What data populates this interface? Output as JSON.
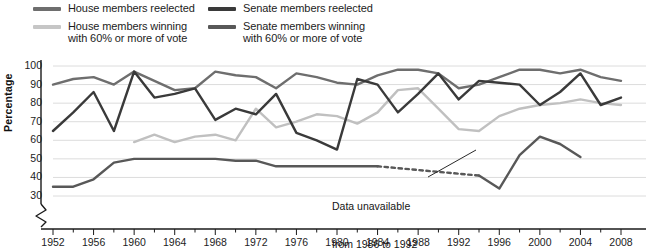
{
  "legend": {
    "items": [
      {
        "label": "House members reelected",
        "color": "#6e6e6e",
        "name": "legend-house-reelected"
      },
      {
        "label": "House members winning\nwith 60% or more of vote",
        "color": "#c0c0c0",
        "name": "legend-house-60"
      },
      {
        "label": "Senate members reelected",
        "color": "#3a3a3a",
        "name": "legend-senate-reelected"
      },
      {
        "label": "Senate members winning\nwith 60% or more of vote",
        "color": "#585858",
        "name": "legend-senate-60"
      }
    ]
  },
  "axes": {
    "ylabel": "Percentage",
    "yticks": [
      "100",
      "90",
      "80",
      "70",
      "60",
      "50",
      "40",
      "30"
    ],
    "xticks": [
      "1952",
      "1956",
      "1960",
      "1964",
      "1968",
      "1972",
      "1976",
      "1980",
      "1984",
      "1988",
      "1992",
      "1996",
      "2000",
      "2004",
      "2008"
    ]
  },
  "annotation": {
    "line1": "Data unavailable",
    "line2": "from 1986 to 1992"
  },
  "chart_data": {
    "type": "line",
    "title": "",
    "xlabel": "",
    "ylabel": "Percentage",
    "xlim": [
      1952,
      2008
    ],
    "ylim": [
      30,
      100
    ],
    "yticks": [
      30,
      40,
      50,
      60,
      70,
      80,
      90,
      100
    ],
    "axis_break_below": 30,
    "grid": true,
    "legend_position": "top",
    "x": [
      1952,
      1954,
      1956,
      1958,
      1960,
      1962,
      1964,
      1966,
      1968,
      1970,
      1972,
      1974,
      1976,
      1978,
      1980,
      1982,
      1984,
      1986,
      1988,
      1990,
      1992,
      1994,
      1996,
      1998,
      2000,
      2002,
      2004,
      2006,
      2008
    ],
    "series": [
      {
        "name": "House members reelected",
        "color": "#6e6e6e",
        "values": [
          90,
          93,
          94,
          90,
          97,
          92,
          87,
          88,
          97,
          95,
          94,
          88,
          96,
          94,
          91,
          90,
          95,
          98,
          98,
          96,
          88,
          90,
          94,
          98,
          98,
          96,
          98,
          94,
          92
        ]
      },
      {
        "name": "House members winning with 60% or more of vote",
        "color": "#c0c0c0",
        "values": [
          null,
          null,
          null,
          null,
          59,
          63,
          59,
          62,
          63,
          60,
          77,
          67,
          70,
          74,
          73,
          69,
          75,
          87,
          88,
          77,
          66,
          65,
          73,
          77,
          79,
          80,
          82,
          80,
          79
        ],
        "gap_note": "series begins 1960"
      },
      {
        "name": "Senate members reelected",
        "color": "#3a3a3a",
        "values": [
          65,
          75,
          86,
          65,
          97,
          83,
          85,
          88,
          71,
          77,
          74,
          85,
          64,
          60,
          55,
          93,
          90,
          75,
          85,
          96,
          82,
          92,
          91,
          90,
          79,
          86,
          96,
          79,
          83
        ]
      },
      {
        "name": "Senate members winning with 60% or more of vote",
        "color": "#585858",
        "values": [
          35,
          35,
          39,
          48,
          50,
          50,
          50,
          50,
          50,
          49,
          49,
          46,
          46,
          46,
          46,
          46,
          46,
          null,
          null,
          null,
          null,
          41,
          34,
          52,
          62,
          58,
          51,
          null,
          null
        ],
        "unavailable_from": 1986,
        "unavailable_to": 1992,
        "gap_note": "dotted interpolation drawn between 1986 and 1992; series ends 2004"
      }
    ],
    "annotations": [
      {
        "text": "Data unavailable from 1986 to 1992",
        "points_to_x": 1989,
        "points_to_y": 44
      }
    ]
  }
}
